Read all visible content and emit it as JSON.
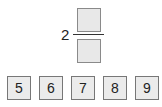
{
  "fraction": {
    "whole_number": "2",
    "numerator": "",
    "denominator": ""
  },
  "tiles": [
    {
      "label": "5"
    },
    {
      "label": "6"
    },
    {
      "label": "7"
    },
    {
      "label": "8"
    },
    {
      "label": "9"
    }
  ]
}
